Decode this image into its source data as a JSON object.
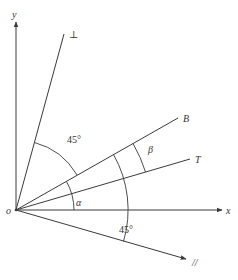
{
  "diagram": {
    "type": "angle-geometry",
    "origin_label": "o",
    "axes": {
      "x_label": "x",
      "y_label": "y"
    },
    "rays": [
      {
        "id": "perpendicular",
        "label": "⊥"
      },
      {
        "id": "B",
        "label": "B"
      },
      {
        "id": "T",
        "label": "T"
      },
      {
        "id": "parallel",
        "label": "//"
      }
    ],
    "angles": [
      {
        "id": "perp-to-B",
        "label": "45°"
      },
      {
        "id": "beta",
        "label": "β"
      },
      {
        "id": "alpha",
        "label": "α"
      },
      {
        "id": "B-to-parallel",
        "label": "45°"
      }
    ],
    "colors": {
      "line": "#3a3a3a",
      "text": "#333333",
      "background": "#ffffff"
    }
  }
}
